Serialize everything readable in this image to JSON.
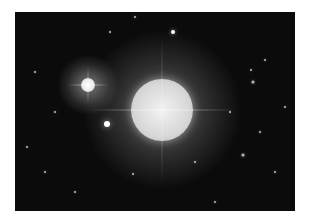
{
  "image": {
    "subject": "star field with bright stars",
    "background_color": "#0b0b0b",
    "main_star": {
      "x": 147,
      "y": 98,
      "radius": 31,
      "halo_radius": 70
    },
    "secondary_star": {
      "x": 73,
      "y": 73,
      "radius": 8,
      "halo_radius": 30
    },
    "minor_stars": [
      {
        "x": 92,
        "y": 112,
        "r": 3
      },
      {
        "x": 158,
        "y": 20,
        "r": 2
      },
      {
        "x": 238,
        "y": 70,
        "r": 1.5
      },
      {
        "x": 228,
        "y": 143,
        "r": 1.5
      },
      {
        "x": 236,
        "y": 58,
        "r": 1
      },
      {
        "x": 12,
        "y": 135,
        "r": 1
      },
      {
        "x": 118,
        "y": 162,
        "r": 1
      },
      {
        "x": 250,
        "y": 48,
        "r": 1
      },
      {
        "x": 40,
        "y": 100,
        "r": 1
      },
      {
        "x": 200,
        "y": 190,
        "r": 1
      },
      {
        "x": 270,
        "y": 95,
        "r": 1
      },
      {
        "x": 120,
        "y": 5,
        "r": 1
      },
      {
        "x": 60,
        "y": 180,
        "r": 1
      },
      {
        "x": 180,
        "y": 150,
        "r": 1
      },
      {
        "x": 260,
        "y": 160,
        "r": 1
      },
      {
        "x": 20,
        "y": 60,
        "r": 1
      },
      {
        "x": 245,
        "y": 120,
        "r": 1
      },
      {
        "x": 30,
        "y": 160,
        "r": 1
      },
      {
        "x": 95,
        "y": 20,
        "r": 1
      },
      {
        "x": 215,
        "y": 100,
        "r": 1
      }
    ]
  }
}
